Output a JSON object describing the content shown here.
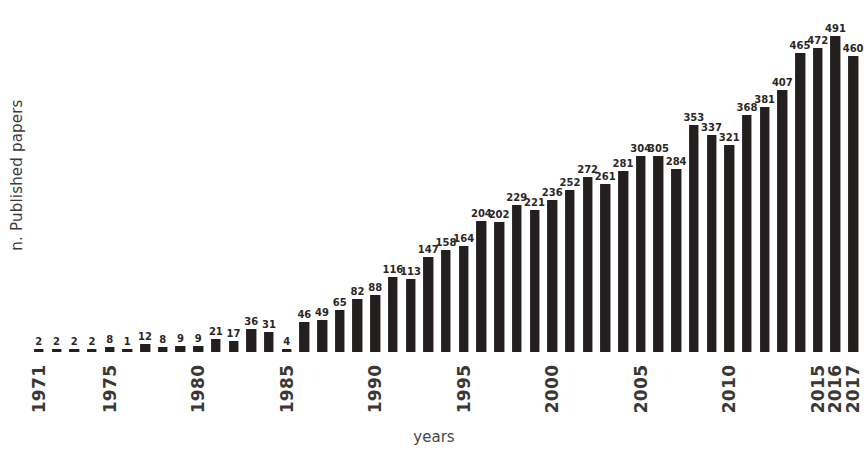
{
  "chart_data": {
    "type": "bar",
    "title": "",
    "subtitle": "",
    "xlabel": "years",
    "ylabel": "n. Published papers",
    "grid": false,
    "legend": null,
    "bar_color": "#241f1f",
    "value_label_color": "#2b2726",
    "ylim": [
      0,
      491
    ],
    "xlim_categories": [
      "1971",
      "2017"
    ],
    "x_tick_labels_shown": [
      "1971",
      "1975",
      "1980",
      "1985",
      "1990",
      "1995",
      "2000",
      "2005",
      "2010",
      "2015",
      "2016",
      "2017"
    ],
    "categories": [
      "1971",
      "1972",
      "1973",
      "1974",
      "1975",
      "1976",
      "1977",
      "1978",
      "1979",
      "1980",
      "1981",
      "1982",
      "1983",
      "1984",
      "1985",
      "1986",
      "1987",
      "1988",
      "1989",
      "1990",
      "1991",
      "1992",
      "1993",
      "1994",
      "1995",
      "1996",
      "1997",
      "1998",
      "1999",
      "2000",
      "2001",
      "2002",
      "2003",
      "2004",
      "2005",
      "2006",
      "2007",
      "2008",
      "2009",
      "2010",
      "2011",
      "2012",
      "2013",
      "2014",
      "2015",
      "2016",
      "2017"
    ],
    "values": [
      2,
      2,
      2,
      2,
      8,
      1,
      12,
      8,
      9,
      9,
      21,
      17,
      36,
      31,
      4,
      46,
      49,
      65,
      82,
      88,
      116,
      113,
      147,
      158,
      164,
      204,
      202,
      229,
      221,
      236,
      252,
      272,
      261,
      281,
      304,
      305,
      284,
      353,
      337,
      321,
      368,
      381,
      407,
      465,
      472,
      491,
      460
    ],
    "data_labels_shown": true
  }
}
